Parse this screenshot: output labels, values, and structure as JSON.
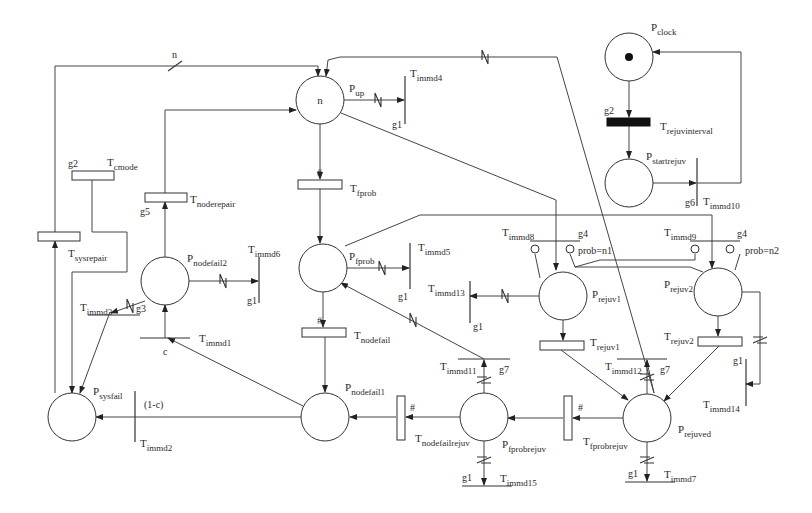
{
  "places": [
    {
      "id": "Pup",
      "name": "P",
      "sub": "up",
      "cx": 320,
      "cy": 100,
      "r": 24,
      "tokens": "n",
      "lx": 349,
      "ly": 92
    },
    {
      "id": "Pclock",
      "name": "P",
      "sub": "clock",
      "cx": 629,
      "cy": 57,
      "r": 24,
      "dot": true,
      "lx": 651,
      "ly": 31
    },
    {
      "id": "Pstartrejuv",
      "name": "P",
      "sub": "startrejuv",
      "cx": 629,
      "cy": 183,
      "r": 24,
      "lx": 646,
      "ly": 160
    },
    {
      "id": "Pnodefail2",
      "name": "P",
      "sub": "nodefail2",
      "cx": 165,
      "cy": 281,
      "r": 24,
      "lx": 187,
      "ly": 262
    },
    {
      "id": "Pfprob",
      "name": "P",
      "sub": "fprob",
      "cx": 323,
      "cy": 268,
      "r": 24,
      "lx": 349,
      "ly": 260
    },
    {
      "id": "Prejuv1",
      "name": "P",
      "sub": "rejuv1",
      "cx": 563,
      "cy": 296,
      "r": 24,
      "lx": 592,
      "ly": 298
    },
    {
      "id": "Prejuv2",
      "name": "P",
      "sub": "rejuv2",
      "cx": 718,
      "cy": 292,
      "r": 24,
      "lx": 664,
      "ly": 288
    },
    {
      "id": "Psysfail",
      "name": "P",
      "sub": "sysfail",
      "cx": 72,
      "cy": 417,
      "r": 24,
      "lx": 93,
      "ly": 395
    },
    {
      "id": "Pnodefail1",
      "name": "P",
      "sub": "nodefail1",
      "cx": 325,
      "cy": 417,
      "r": 24,
      "lx": 345,
      "ly": 391
    },
    {
      "id": "Pfprobrejuv",
      "name": "P",
      "sub": "fprobrejuv",
      "cx": 484,
      "cy": 417,
      "r": 24,
      "lx": 502,
      "ly": 448
    },
    {
      "id": "Prejuved",
      "name": "P",
      "sub": "rejuved",
      "cx": 647,
      "cy": 418,
      "r": 24,
      "lx": 678,
      "ly": 433
    }
  ],
  "timed_transitions": [
    {
      "id": "Tcmode",
      "name": "T",
      "sub": "cmode",
      "x": 72,
      "y": 171,
      "w": 42,
      "h": 9,
      "lx": 107,
      "ly": 166,
      "guard": "g2",
      "gx": 68,
      "gy": 167
    },
    {
      "id": "Tnoderepair",
      "name": "T",
      "sub": "noderepair",
      "x": 145,
      "y": 193,
      "w": 42,
      "h": 9,
      "lx": 190,
      "ly": 203,
      "guard": "g5",
      "gx": 140,
      "gy": 215
    },
    {
      "id": "Tsysrepair",
      "name": "T",
      "sub": "sysrepair",
      "x": 38,
      "y": 232,
      "w": 42,
      "h": 9,
      "lx": 68,
      "ly": 257
    },
    {
      "id": "Tfprob",
      "name": "T",
      "sub": "fprob",
      "x": 298,
      "y": 180,
      "w": 44,
      "h": 9,
      "lx": 350,
      "ly": 192,
      "mark": "#",
      "mx": 317,
      "my": 176
    },
    {
      "id": "Tnodefail",
      "name": "T",
      "sub": "nodefail",
      "x": 302,
      "y": 328,
      "w": 44,
      "h": 9,
      "lx": 354,
      "ly": 339,
      "mark": "#",
      "mx": 317,
      "my": 324
    },
    {
      "id": "Trejuv1",
      "name": "T",
      "sub": "rejuv1",
      "x": 540,
      "y": 341,
      "w": 44,
      "h": 9,
      "lx": 590,
      "ly": 346
    },
    {
      "id": "Trejuv2",
      "name": "T",
      "sub": "rejuv2",
      "x": 698,
      "y": 337,
      "w": 44,
      "h": 9,
      "lx": 664,
      "ly": 340
    },
    {
      "id": "Tnodefailrejuv",
      "name": "T",
      "sub": "nodefailrejuv",
      "x": 397,
      "y": 396,
      "w": 8,
      "h": 44,
      "lx": 415,
      "ly": 442,
      "mark": "#",
      "mx": 410,
      "my": 411
    },
    {
      "id": "Tfprobrejuv",
      "name": "T",
      "sub": "fprobrejuv",
      "x": 564,
      "y": 396,
      "w": 8,
      "h": 44,
      "lx": 583,
      "ly": 445,
      "mark": "#",
      "mx": 578,
      "my": 411
    }
  ],
  "black_transitions": [
    {
      "id": "Trejuvinterval",
      "name": "T",
      "sub": "rejuvinterval",
      "x": 607,
      "y": 118,
      "w": 43,
      "h": 8,
      "lx": 660,
      "ly": 130,
      "guard": "g2",
      "gx": 604,
      "gy": 114
    }
  ],
  "immediate_transitions": [
    {
      "id": "Timmd4",
      "name": "T",
      "sub": "immd4",
      "orient": "v",
      "x": 405,
      "y1": 76,
      "y2": 124,
      "lx": 410,
      "ly": 77,
      "guard": "g1",
      "gx": 392,
      "gy": 128
    },
    {
      "id": "Timmd10",
      "name": "T",
      "sub": "immd10",
      "orient": "v",
      "x": 697,
      "y1": 158,
      "y2": 206,
      "lx": 703,
      "ly": 205,
      "guard": "g6",
      "gx": 685,
      "gy": 206
    },
    {
      "id": "Timmd6",
      "name": "T",
      "sub": "immd6",
      "orient": "v",
      "x": 259,
      "y1": 257,
      "y2": 303,
      "lx": 248,
      "ly": 253,
      "guard": "g1",
      "gx": 247,
      "gy": 304
    },
    {
      "id": "Timmd5",
      "name": "T",
      "sub": "immd5",
      "orient": "v",
      "x": 410,
      "y1": 243,
      "y2": 289,
      "lx": 418,
      "ly": 251,
      "guard": "g1",
      "gx": 398,
      "gy": 300
    },
    {
      "id": "Timmd13",
      "name": "T",
      "sub": "immd13",
      "orient": "v",
      "x": 470,
      "y1": 281,
      "y2": 323,
      "lx": 428,
      "ly": 292,
      "guard": "g1",
      "gx": 473,
      "gy": 330
    },
    {
      "id": "Timmd14",
      "name": "T",
      "sub": "immd14",
      "orient": "v",
      "x": 746,
      "y1": 359,
      "y2": 406,
      "lx": 703,
      "ly": 408,
      "guard": "g1",
      "gx": 733,
      "gy": 364
    },
    {
      "id": "Timmd2",
      "name": "T",
      "sub": "immd2",
      "orient": "v",
      "x": 135,
      "y1": 391,
      "y2": 442,
      "lx": 140,
      "ly": 447,
      "label2": "(1-c)",
      "l2x": 144,
      "l2y": 408
    },
    {
      "id": "Timmd3",
      "name": "T",
      "sub": "immd3",
      "orient": "h",
      "y": 315,
      "x1": 88,
      "x2": 140,
      "lx": 80,
      "ly": 311,
      "guard": "g3",
      "gx": 136,
      "gy": 312
    },
    {
      "id": "Timmd1",
      "name": "T",
      "sub": "immd1",
      "orient": "h",
      "y": 338,
      "x1": 140,
      "x2": 190,
      "lx": 199,
      "ly": 342,
      "label2": "c",
      "l2x": 163,
      "l2y": 355
    },
    {
      "id": "Timmd8",
      "name": "T",
      "sub": "immd8",
      "orient": "h",
      "y": 241,
      "x1": 530,
      "x2": 580,
      "lx": 502,
      "ly": 236,
      "guard": "g4",
      "gx": 578,
      "gy": 237
    },
    {
      "id": "Timmd9",
      "name": "T",
      "sub": "immd9",
      "orient": "h",
      "y": 241,
      "x1": 690,
      "x2": 740,
      "lx": 664,
      "ly": 236,
      "guard": "g4",
      "gx": 737,
      "gy": 237
    },
    {
      "id": "Timmd11",
      "name": "T",
      "sub": "immd11",
      "orient": "h",
      "y": 359,
      "x1": 458,
      "x2": 510,
      "lx": 440,
      "ly": 370,
      "guard": "g7",
      "gx": 499,
      "gy": 373
    },
    {
      "id": "Timmd12",
      "name": "T",
      "sub": "immd12",
      "orient": "h",
      "y": 359,
      "x1": 617,
      "x2": 667,
      "lx": 605,
      "ly": 370,
      "guard": "g7",
      "gx": 660,
      "gy": 373
    },
    {
      "id": "Timmd15",
      "name": "T",
      "sub": "immd15",
      "orient": "h",
      "y": 486,
      "x1": 462,
      "x2": 512,
      "lx": 500,
      "ly": 482,
      "guard": "g1",
      "gx": 462,
      "gy": 481
    },
    {
      "id": "Timmd7",
      "name": "T",
      "sub": "immd7",
      "orient": "h",
      "y": 482,
      "x1": 625,
      "x2": 675,
      "lx": 664,
      "ly": 478,
      "guard": "g1",
      "gx": 628,
      "gy": 477
    }
  ],
  "annotations": [
    {
      "text": "n",
      "x": 172,
      "y": 58
    },
    {
      "text": "prob=n1",
      "x": 578,
      "y": 254
    },
    {
      "text": "prob=n2",
      "x": 745,
      "y": 254
    }
  ],
  "arcs": [
    {
      "d": "M55 232 L55 66 L318 66 L318 76",
      "arrow": true,
      "slash": "single",
      "sx": 175,
      "sy": 66
    },
    {
      "d": "M165 193 L165 110 L296 110",
      "arrow": true
    },
    {
      "d": "M92 180 L92 232 L127 232 L127 272 L72 272 L72 393",
      "arrow": true
    },
    {
      "d": "M55 393 L55 241",
      "arrow": true
    },
    {
      "d": "M165 257 L165 202",
      "arrow": true
    },
    {
      "d": "M110 312 L80 393",
      "arrow": true
    },
    {
      "d": "M145 301 L111 313",
      "arrow": true,
      "slash": "double",
      "sx": 130,
      "sy": 306
    },
    {
      "d": "M165 338 L165 305",
      "arrow": true
    },
    {
      "d": "M303 406 L168 338",
      "arrow": true
    },
    {
      "d": "M301 417 L135 417 L96 417",
      "arrow": true
    },
    {
      "d": "M189 281 L258 281",
      "arrow": true,
      "slash": "double",
      "sx": 223,
      "sy": 281
    },
    {
      "d": "M344 100 L404 100",
      "arrow": true,
      "slash": "double",
      "sx": 378,
      "sy": 100
    },
    {
      "d": "M320 124 L320 179",
      "arrow": true
    },
    {
      "d": "M320 189 L320 243",
      "arrow": true
    },
    {
      "d": "M347 268 L409 268",
      "arrow": true,
      "slash": "double",
      "sx": 382,
      "sy": 268
    },
    {
      "d": "M323 292 L323 327",
      "arrow": true
    },
    {
      "d": "M325 337 L325 392",
      "arrow": true
    },
    {
      "d": "M484 359 L341 283",
      "arrow": true,
      "slash": "double",
      "sx": 413,
      "sy": 320
    },
    {
      "d": "M484 393 L484 360",
      "arrow": true,
      "slash": "double-h",
      "sx": 484,
      "sy": 380
    },
    {
      "d": "M460 417 L406 417",
      "arrow": true
    },
    {
      "d": "M396 417 L350 417",
      "arrow": true
    },
    {
      "d": "M484 441 L484 485",
      "arrow": true,
      "slash": "double-h",
      "sx": 484,
      "sy": 460
    },
    {
      "d": "M341 113 L556 200 L556 270",
      "arrow": true
    },
    {
      "d": "M340 57 L360 57 L430 57 L557 57 L654 393",
      "arrow": false,
      "slash": "double",
      "sx": 485,
      "sy": 57
    },
    {
      "d": "M654 393 L647 362",
      "arrow": false
    },
    {
      "d": "M340 57 L328 60 L326 76",
      "arrow": true
    },
    {
      "d": "M647 394 L647 360",
      "arrow": true,
      "slash": "double-h",
      "sx": 647,
      "sy": 377
    },
    {
      "d": "M345 246 L420 215 L712 215 L712 268",
      "arrow": true
    },
    {
      "d": "M539 296 L470 296",
      "arrow": true,
      "slash": "double",
      "sx": 505,
      "sy": 296
    },
    {
      "d": "M563 320 L563 340",
      "arrow": true
    },
    {
      "d": "M561 350 L628 400",
      "arrow": true
    },
    {
      "d": "M719 346 L664 401",
      "arrow": true
    },
    {
      "d": "M718 316 L718 336",
      "arrow": true
    },
    {
      "d": "M623 418 L573 418",
      "arrow": true
    },
    {
      "d": "M563 418 L508 418",
      "arrow": true
    },
    {
      "d": "M647 442 L647 481",
      "arrow": true,
      "slash": "double-h",
      "sx": 647,
      "sy": 460
    },
    {
      "d": "M742 292 L760 292 L760 384 L746 384",
      "arrow": true,
      "slash": "double-h",
      "sx": 760,
      "sy": 340
    },
    {
      "d": "M629 81 L629 117",
      "arrow": true
    },
    {
      "d": "M629 126 L629 158",
      "arrow": true
    },
    {
      "d": "M653 183 L696 183",
      "arrow": true
    },
    {
      "d": "M697 183 L741 183 L741 52 L653 52",
      "arrow": true
    },
    {
      "d": "M535 254 L540 278",
      "arrow": false
    },
    {
      "d": "M570 254 L575 267 L600 260 L695 260 L695 254",
      "arrow": false
    },
    {
      "d": "M575 267 L690 267 L703 272",
      "arrow": false
    },
    {
      "d": "M740 254 L735 270",
      "arrow": false
    }
  ],
  "inhibitors": [
    {
      "cx": 535,
      "cy": 249,
      "r": 4
    },
    {
      "cx": 570,
      "cy": 249,
      "r": 4
    },
    {
      "cx": 695,
      "cy": 249,
      "r": 4
    },
    {
      "cx": 730,
      "cy": 249,
      "r": 4
    }
  ]
}
